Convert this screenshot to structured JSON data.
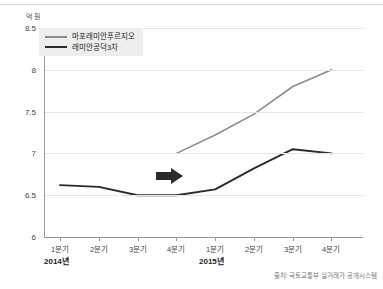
{
  "chart_data": {
    "type": "line",
    "title": "",
    "subtitle": "",
    "unit_label": "억 원",
    "xlabel": "",
    "ylabel": "",
    "ylim": [
      6,
      8.5
    ],
    "yticks": [
      "8.5",
      "8",
      "7.5",
      "7",
      "6.5",
      "6"
    ],
    "ytick_values": [
      8.5,
      8,
      7.5,
      7,
      6.5,
      6
    ],
    "grid": "horizontal",
    "legend_position": "top-left",
    "categories": [
      "1분기",
      "2분기",
      "3분기",
      "4분기",
      "1분기",
      "2분기",
      "3분기",
      "4분기"
    ],
    "x_groups": [
      {
        "label": "2014년",
        "quarters": [
          "1분기",
          "2분기",
          "3분기",
          "4분기"
        ]
      },
      {
        "label": "2015년",
        "quarters": [
          "1분기",
          "2분기",
          "3분기",
          "4분기"
        ]
      }
    ],
    "series": [
      {
        "name": "마포래미안푸르지오",
        "color": "#8c8c8c",
        "values": [
          null,
          null,
          null,
          7.0,
          7.22,
          7.47,
          7.8,
          8.0
        ]
      },
      {
        "name": "래미안공덕3차",
        "color": "#2b2b2b",
        "values": [
          6.62,
          6.6,
          6.5,
          6.5,
          6.57,
          6.82,
          7.05,
          7.0
        ]
      }
    ],
    "annotations": [
      {
        "type": "arrow",
        "direction": "right",
        "color": "#2b2b2b",
        "at_category": "4분기 2014년"
      }
    ],
    "source": "출처: 국토교통부 실거래가 공개시스템"
  },
  "legend": {
    "items": [
      {
        "label": "마포래미안푸르지오",
        "color": "#8c8c8c"
      },
      {
        "label": "래미안공덕3차",
        "color": "#2b2b2b"
      }
    ]
  }
}
